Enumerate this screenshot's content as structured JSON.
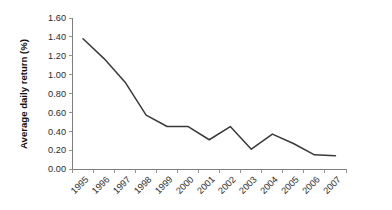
{
  "chart_data": {
    "type": "line",
    "title": "",
    "subtitle": "",
    "xlabel": "",
    "ylabel": "Average daily return (%)",
    "categories": [
      "1995",
      "1996",
      "1997",
      "1998",
      "1999",
      "2000",
      "2001",
      "2002",
      "2003",
      "2004",
      "2005",
      "2006",
      "2007"
    ],
    "values": [
      1.38,
      1.17,
      0.92,
      0.57,
      0.45,
      0.45,
      0.31,
      0.45,
      0.21,
      0.37,
      0.27,
      0.15,
      0.14
    ],
    "series": [
      {
        "name": "Average daily return",
        "color": "#3a3a3a",
        "values": [
          1.38,
          1.17,
          0.92,
          0.57,
          0.45,
          0.45,
          0.31,
          0.45,
          0.21,
          0.37,
          0.27,
          0.15,
          0.14
        ]
      }
    ],
    "ylim": [
      0.0,
      1.6
    ],
    "ytick_values": [
      0.0,
      0.2,
      0.4,
      0.6,
      0.8,
      1.0,
      1.2,
      1.4,
      1.6
    ],
    "ytick_labels": [
      "0.00",
      "0.20",
      "0.40",
      "0.60",
      "0.80",
      "1.00",
      "1.20",
      "1.40",
      "1.60"
    ],
    "ytick_step": 0.2,
    "grid": false,
    "legend": false,
    "legend_position": "none",
    "markers": false,
    "xtick_label_rotation": -45,
    "annotations": []
  },
  "axes": {
    "y_axis_title": "Average daily return (%)"
  },
  "colors": {
    "background": "#ffffff",
    "line": "#3a3a3a",
    "axis": "#7d7d7d",
    "tick": "#8a8a8a",
    "text": "#2b2b2b",
    "title_text": "#111111"
  }
}
